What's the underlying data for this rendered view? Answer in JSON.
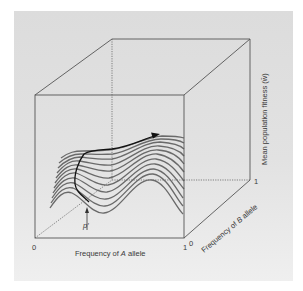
{
  "figure": {
    "x_axis_label_prefix": "Frequency of ",
    "x_axis_label_var": "A",
    "x_axis_label_suffix": " allele",
    "y_axis_label_prefix": "Frequency of ",
    "y_axis_label_var": "B",
    "y_axis_label_suffix": " allele",
    "z_axis_label": "Mean population fitness (w̄)",
    "x_tick_start": "0",
    "x_tick_end": "1",
    "y_tick_start": "0",
    "y_tick_end": "1",
    "marker_label": "p′",
    "colors": {
      "background": "#e0e0e0",
      "box_lines": "#555555",
      "surface_lines": "#6a6a6a",
      "trajectory": "#111111"
    }
  }
}
